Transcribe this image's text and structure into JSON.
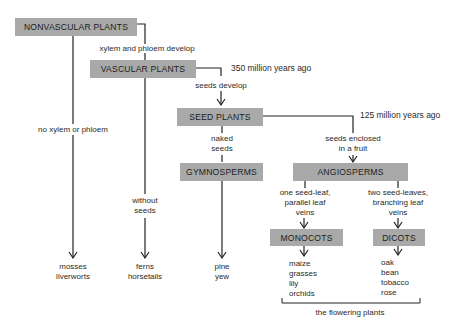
{
  "diagram": {
    "boxes": {
      "nonvascular": "NONVASCULAR PLANTS",
      "vascular": "VASCULAR PLANTS",
      "seed": "SEED PLANTS",
      "gymnosperms": "GYMNOSPERMS",
      "angiosperms": "ANGIOSPERMS",
      "monocots": "MONOCOTS",
      "dicots": "DICOTS"
    },
    "edge_labels": {
      "xylem_phloem_develop": "xylem and phloem develop",
      "no_xylem_phloem": "no xylem or phloem",
      "seeds_develop": "seeds develop",
      "without_seeds_1": "without",
      "without_seeds_2": "seeds",
      "naked_seeds_1": "naked",
      "naked_seeds_2": "seeds",
      "enclosed_1": "seeds enclosed",
      "enclosed_2": "in a fruit",
      "mono_1": "one seed-leaf,",
      "mono_2": "parallel leaf",
      "mono_3": "veins",
      "di_1": "two seed-leaves,",
      "di_2": "branching leaf",
      "di_3": "veins"
    },
    "time_labels": {
      "vascular": "350 million years ago",
      "angiosperm": "125 million years ago"
    },
    "examples": {
      "nonvascular": [
        "mosses",
        "liverworts"
      ],
      "ferns": [
        "ferns",
        "horsetails"
      ],
      "gymnosperms": [
        "pine",
        "yew"
      ],
      "monocots": [
        "maize",
        "grasses",
        "lily",
        "orchids"
      ],
      "dicots": [
        "oak",
        "bean",
        "tobacco",
        "rose"
      ]
    },
    "bracket_label": "the flowering plants"
  }
}
